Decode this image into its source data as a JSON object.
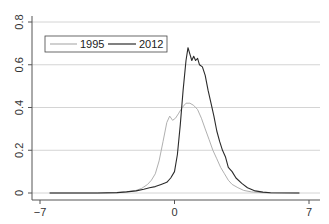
{
  "chart_data": {
    "type": "line",
    "title": "",
    "xlabel": "",
    "ylabel": "",
    "xlim": [
      -7,
      7
    ],
    "ylim": [
      0,
      0.8
    ],
    "xticks": [
      -7,
      0,
      7
    ],
    "xtick_labels": [
      "-7",
      "0",
      "7"
    ],
    "yticks": [
      0,
      0.2,
      0.4,
      0.6,
      0.8
    ],
    "ytick_labels": [
      "0",
      "0.2",
      "0.4",
      "0.6",
      "0.8"
    ],
    "grid": "horizontal",
    "legend": {
      "placement": "top-left",
      "entries": [
        "1995",
        "2012"
      ]
    },
    "series": [
      {
        "name": "1995",
        "color": "#b0b0b0",
        "x": [
          -6.5,
          -4,
          -3,
          -2.5,
          -2,
          -1.7,
          -1.4,
          -1.2,
          -1.0,
          -0.8,
          -0.6,
          -0.4,
          -0.25,
          -0.1,
          0.05,
          0.2,
          0.4,
          0.6,
          0.8,
          1.0,
          1.2,
          1.4,
          1.6,
          1.8,
          2.0,
          2.2,
          2.4,
          2.6,
          2.8,
          3.0,
          3.3,
          3.6,
          4.0,
          4.5,
          5,
          6.5
        ],
        "y": [
          0,
          0,
          0.002,
          0.005,
          0.012,
          0.022,
          0.04,
          0.06,
          0.09,
          0.15,
          0.24,
          0.33,
          0.36,
          0.34,
          0.35,
          0.37,
          0.4,
          0.42,
          0.42,
          0.41,
          0.39,
          0.35,
          0.3,
          0.25,
          0.2,
          0.16,
          0.12,
          0.09,
          0.06,
          0.04,
          0.025,
          0.012,
          0.005,
          0.002,
          0,
          0
        ]
      },
      {
        "name": "2012",
        "color": "#2b2b2b",
        "x": [
          -6.5,
          -4,
          -3,
          -2.5,
          -2,
          -1.6,
          -1.3,
          -1.0,
          -0.7,
          -0.4,
          -0.2,
          0,
          0.15,
          0.3,
          0.45,
          0.6,
          0.7,
          0.8,
          0.9,
          1.0,
          1.1,
          1.2,
          1.3,
          1.45,
          1.6,
          1.75,
          1.9,
          2.05,
          2.2,
          2.35,
          2.5,
          2.65,
          2.8,
          3.0,
          3.2,
          3.5,
          3.8,
          4.2,
          4.6,
          5.0,
          6.5
        ],
        "y": [
          0,
          0,
          0.002,
          0.005,
          0.01,
          0.018,
          0.025,
          0.03,
          0.04,
          0.05,
          0.07,
          0.1,
          0.18,
          0.32,
          0.48,
          0.62,
          0.68,
          0.65,
          0.62,
          0.64,
          0.62,
          0.63,
          0.6,
          0.59,
          0.55,
          0.48,
          0.42,
          0.36,
          0.29,
          0.24,
          0.2,
          0.17,
          0.12,
          0.1,
          0.07,
          0.045,
          0.025,
          0.01,
          0.004,
          0.001,
          0
        ]
      }
    ]
  }
}
